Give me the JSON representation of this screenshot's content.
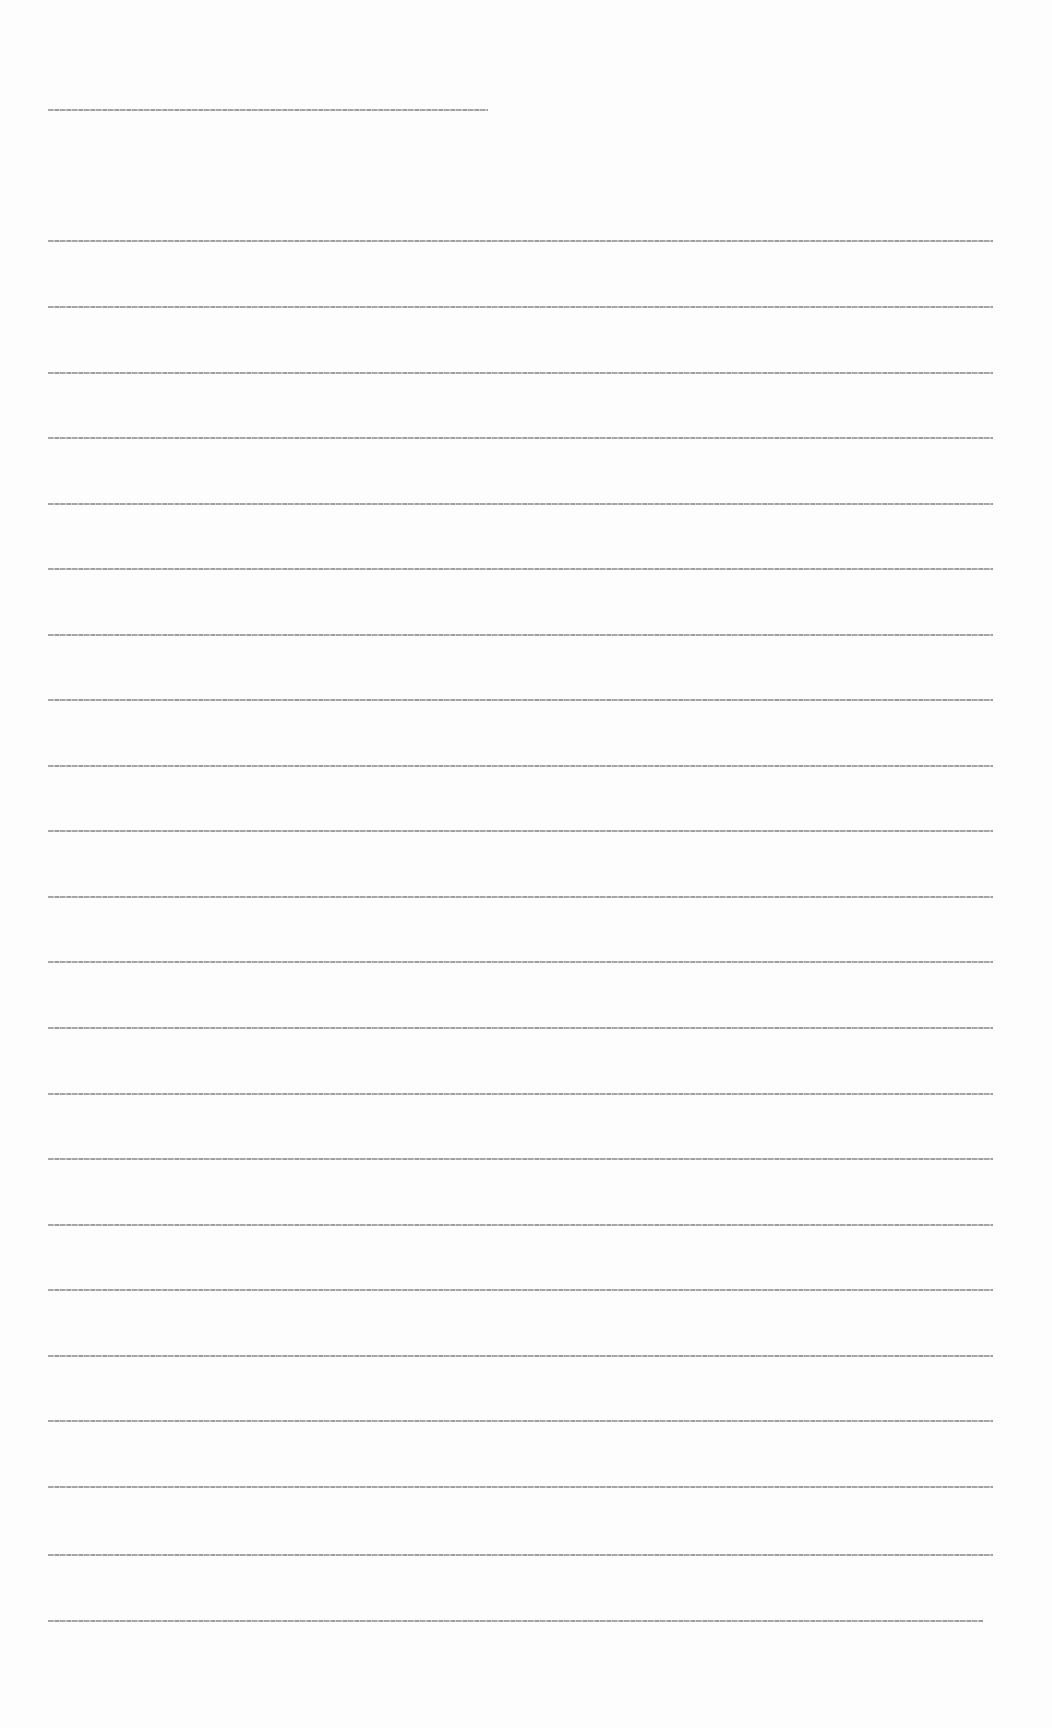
{
  "document": {
    "header": {
      "text": "[illegible header line]"
    },
    "lines": [
      {
        "text": "[illegible text line 1]",
        "top": 240
      },
      {
        "text": "[illegible text line 2]",
        "top": 306
      },
      {
        "text": "[illegible text line 3]",
        "top": 372
      },
      {
        "text": "[illegible text line 4]",
        "top": 437
      },
      {
        "text": "[illegible text line 5]",
        "top": 503
      },
      {
        "text": "[illegible text line 6]",
        "top": 568
      },
      {
        "text": "[illegible text line 7]",
        "top": 634
      },
      {
        "text": "[illegible text line 8]",
        "top": 699
      },
      {
        "text": "[illegible text line 9]",
        "top": 765
      },
      {
        "text": "[illegible text line 10]",
        "top": 830
      },
      {
        "text": "[illegible text line 11]",
        "top": 896
      },
      {
        "text": "[illegible text line 12]",
        "top": 961
      },
      {
        "text": "[illegible text line 13]",
        "top": 1027
      },
      {
        "text": "[illegible text line 14]",
        "top": 1093
      },
      {
        "text": "[illegible text line 15]",
        "top": 1158
      },
      {
        "text": "[illegible text line 16]",
        "top": 1224
      },
      {
        "text": "[illegible text line 17]",
        "top": 1289
      },
      {
        "text": "[illegible text line 18]",
        "top": 1355
      },
      {
        "text": "[illegible text line 19]",
        "top": 1420
      },
      {
        "text": "[illegible text line 20]",
        "top": 1486
      },
      {
        "text": "[illegible text line 21]",
        "top": 1554
      },
      {
        "text": "[illegible text line 22]",
        "top": 1620
      }
    ]
  }
}
